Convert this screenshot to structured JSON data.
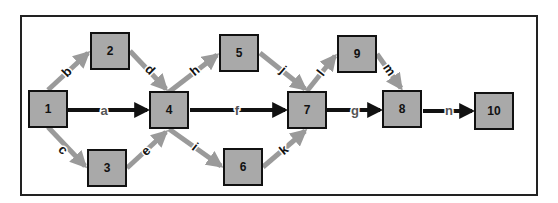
{
  "diagram": {
    "type": "activity-on-arrow network",
    "nodes": [
      {
        "id": "1",
        "label": "1",
        "x": 28,
        "y": 90
      },
      {
        "id": "2",
        "label": "2",
        "x": 90,
        "y": 32
      },
      {
        "id": "3",
        "label": "3",
        "x": 87,
        "y": 149
      },
      {
        "id": "4",
        "label": "4",
        "x": 149,
        "y": 91
      },
      {
        "id": "5",
        "label": "5",
        "x": 219,
        "y": 34
      },
      {
        "id": "6",
        "label": "6",
        "x": 223,
        "y": 148
      },
      {
        "id": "7",
        "label": "7",
        "x": 287,
        "y": 91
      },
      {
        "id": "8",
        "label": "8",
        "x": 382,
        "y": 90
      },
      {
        "id": "9",
        "label": "9",
        "x": 337,
        "y": 35
      },
      {
        "id": "10",
        "label": "10",
        "x": 474,
        "y": 92
      }
    ],
    "edges": [
      {
        "label": "a",
        "from": "1",
        "to": "4",
        "style": "critical"
      },
      {
        "label": "b",
        "from": "1",
        "to": "2",
        "style": "normal"
      },
      {
        "label": "c",
        "from": "1",
        "to": "3",
        "style": "normal"
      },
      {
        "label": "d",
        "from": "2",
        "to": "4",
        "style": "normal"
      },
      {
        "label": "e",
        "from": "3",
        "to": "4",
        "style": "normal"
      },
      {
        "label": "f",
        "from": "4",
        "to": "7",
        "style": "critical"
      },
      {
        "label": "g",
        "from": "7",
        "to": "8",
        "style": "critical"
      },
      {
        "label": "h",
        "from": "4",
        "to": "5",
        "style": "normal"
      },
      {
        "label": "i",
        "from": "4",
        "to": "6",
        "style": "normal"
      },
      {
        "label": "j",
        "from": "5",
        "to": "7",
        "style": "normal"
      },
      {
        "label": "k",
        "from": "6",
        "to": "7",
        "style": "normal"
      },
      {
        "label": "l",
        "from": "7",
        "to": "9",
        "style": "normal"
      },
      {
        "label": "m",
        "from": "9",
        "to": "8",
        "style": "normal"
      },
      {
        "label": "n",
        "from": "8",
        "to": "10",
        "style": "critical"
      }
    ],
    "colors": {
      "node_fill": "#a9a9a9",
      "node_border": "#111111",
      "critical_arrow": "#111111",
      "normal_arrow": "#9a9a9a",
      "frame": "#222222"
    }
  }
}
